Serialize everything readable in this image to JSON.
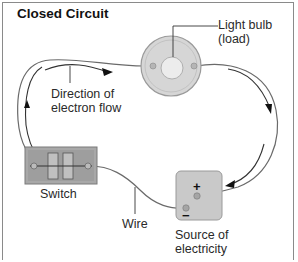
{
  "title": "Closed Circuit",
  "labels": {
    "bulb_line1": "Light bulb",
    "bulb_line2": "(load)",
    "direction_line1": "Direction of",
    "direction_line2": "electron flow",
    "switch": "Switch",
    "wire": "Wire",
    "source_line1": "Source of",
    "source_line2": "electricity",
    "plus": "+",
    "minus": "−"
  },
  "colors": {
    "wire": "#6a6a6a",
    "component_fill": "#c8c8c8",
    "bulb_fill": "#d9d9d9",
    "text": "#2a2a2a"
  }
}
